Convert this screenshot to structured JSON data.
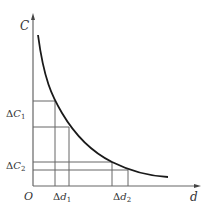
{
  "diagram": {
    "type": "cost-distance curve with increment intervals",
    "y_axis_label": "C",
    "x_axis_label": "d",
    "origin_label": "O",
    "y_ticks": [
      {
        "delta": "Δ",
        "var": "C",
        "sub": "1"
      },
      {
        "delta": "Δ",
        "var": "C",
        "sub": "2"
      }
    ],
    "x_ticks": [
      {
        "delta": "Δ",
        "var": "d",
        "sub": "1"
      },
      {
        "delta": "Δ",
        "var": "d",
        "sub": "2"
      }
    ],
    "colors": {
      "curve": "#1a1a1a",
      "axes": "#555555",
      "guides": "#555555",
      "text": "#333333"
    }
  }
}
